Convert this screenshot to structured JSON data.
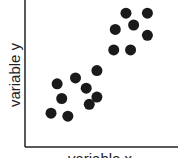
{
  "chart_data": {
    "type": "scatter",
    "title": "",
    "xlabel": "variable x",
    "ylabel": "variable y",
    "grid": false,
    "ticks": false,
    "xlim": [
      0,
      100
    ],
    "ylim": [
      0,
      100
    ],
    "point_color": "#1a1a1a",
    "axis_color": "#222222",
    "series": [
      {
        "name": "lower cluster",
        "points": [
          {
            "x": 17,
            "y": 23
          },
          {
            "x": 21,
            "y": 43
          },
          {
            "x": 24,
            "y": 33
          },
          {
            "x": 28,
            "y": 21
          },
          {
            "x": 33,
            "y": 47
          },
          {
            "x": 40,
            "y": 40
          },
          {
            "x": 42,
            "y": 29
          },
          {
            "x": 47,
            "y": 34
          },
          {
            "x": 47,
            "y": 52
          }
        ]
      },
      {
        "name": "upper cluster",
        "points": [
          {
            "x": 59,
            "y": 80
          },
          {
            "x": 58,
            "y": 66
          },
          {
            "x": 66,
            "y": 91
          },
          {
            "x": 71,
            "y": 83
          },
          {
            "x": 80,
            "y": 91
          },
          {
            "x": 80,
            "y": 76
          },
          {
            "x": 69,
            "y": 66
          }
        ]
      }
    ]
  }
}
